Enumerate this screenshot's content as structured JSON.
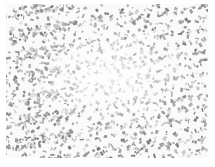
{
  "image": {
    "description": "Grayscale speckled noise texture with lighter center",
    "colors": {
      "background": "#ffffff",
      "speck_dark": "#8a8a8a",
      "speck_light": "#c4c4c4"
    },
    "speck_count": 1400,
    "seed": 7
  }
}
